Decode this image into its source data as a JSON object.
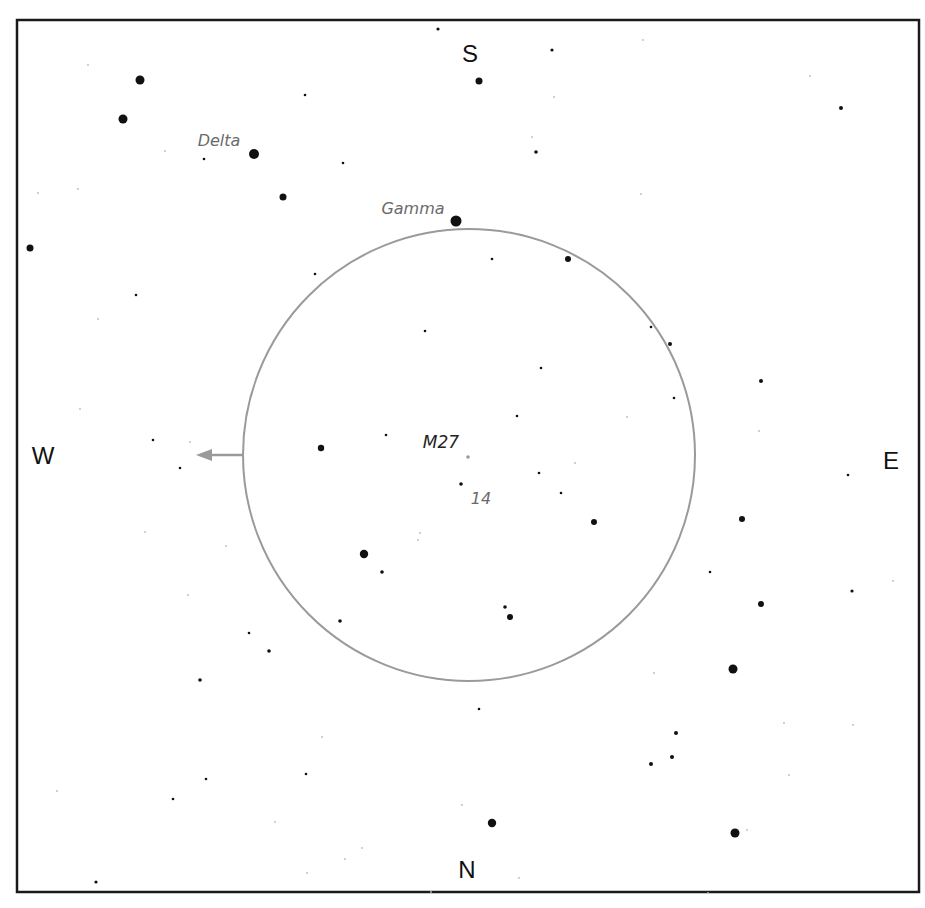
{
  "header": {
    "cropped_title_fragment": ""
  },
  "frame": {
    "x": 17,
    "y": 20,
    "width": 902,
    "height": 872,
    "stroke": "#1a1a1a",
    "stroke_width": 2.5
  },
  "field_of_view": {
    "cx": 469,
    "cy": 455,
    "r": 226,
    "stroke": "#9a9a9a",
    "stroke_width": 2
  },
  "motion_arrow": {
    "x1": 244,
    "y1": 455,
    "x2": 196,
    "y2": 455,
    "color": "#9a9a9a",
    "direction": "west"
  },
  "compass": {
    "north": {
      "label": "N",
      "x": 467,
      "y": 878
    },
    "south": {
      "label": "S",
      "x": 470,
      "y": 62
    },
    "east": {
      "label": "E",
      "x": 891,
      "y": 469
    },
    "west": {
      "label": "W",
      "x": 43,
      "y": 464
    }
  },
  "labels": {
    "delta": {
      "text": "Delta",
      "x": 219,
      "y": 146,
      "color": "#6a6a6a"
    },
    "gamma": {
      "text": "Gamma",
      "x": 413,
      "y": 214,
      "color": "#6a6a6a"
    },
    "m27": {
      "text": "M27",
      "x": 441,
      "y": 448,
      "color": "#222222"
    },
    "mag14": {
      "text": "14",
      "x": 481,
      "y": 504,
      "color": "#6a6a6a"
    }
  },
  "target": {
    "name": "M27",
    "x": 468,
    "y": 457,
    "r": 1.8,
    "color": "#9a9a9a"
  },
  "stars": [
    {
      "x": 140,
      "y": 80,
      "r": 4.5
    },
    {
      "x": 123,
      "y": 119,
      "r": 4.5
    },
    {
      "x": 254,
      "y": 154,
      "r": 5
    },
    {
      "x": 283,
      "y": 197,
      "r": 3.5
    },
    {
      "x": 456,
      "y": 221,
      "r": 5.5
    },
    {
      "x": 30,
      "y": 248,
      "r": 3.5
    },
    {
      "x": 479,
      "y": 81,
      "r": 3.5
    },
    {
      "x": 438,
      "y": 29,
      "r": 1.6
    },
    {
      "x": 552,
      "y": 50,
      "r": 1.6
    },
    {
      "x": 305,
      "y": 95,
      "r": 1.3
    },
    {
      "x": 536,
      "y": 152,
      "r": 1.8
    },
    {
      "x": 204,
      "y": 159,
      "r": 1.3
    },
    {
      "x": 343,
      "y": 163,
      "r": 1.3
    },
    {
      "x": 841,
      "y": 108,
      "r": 2
    },
    {
      "x": 568,
      "y": 259,
      "r": 3
    },
    {
      "x": 492,
      "y": 259,
      "r": 1.3
    },
    {
      "x": 315,
      "y": 274,
      "r": 1.3
    },
    {
      "x": 136,
      "y": 295,
      "r": 1.3
    },
    {
      "x": 425,
      "y": 331,
      "r": 1.3
    },
    {
      "x": 651,
      "y": 327,
      "r": 1.3
    },
    {
      "x": 670,
      "y": 344,
      "r": 2
    },
    {
      "x": 541,
      "y": 368,
      "r": 1.3
    },
    {
      "x": 761,
      "y": 381,
      "r": 2
    },
    {
      "x": 674,
      "y": 398,
      "r": 1.3
    },
    {
      "x": 517,
      "y": 416,
      "r": 1.3
    },
    {
      "x": 386,
      "y": 435,
      "r": 1.3
    },
    {
      "x": 153,
      "y": 440,
      "r": 1.3
    },
    {
      "x": 321,
      "y": 448,
      "r": 3.2
    },
    {
      "x": 180,
      "y": 468,
      "r": 1.3
    },
    {
      "x": 539,
      "y": 473,
      "r": 1.3
    },
    {
      "x": 461,
      "y": 484,
      "r": 1.8
    },
    {
      "x": 561,
      "y": 493,
      "r": 1.3
    },
    {
      "x": 848,
      "y": 475,
      "r": 1.3
    },
    {
      "x": 594,
      "y": 522,
      "r": 3
    },
    {
      "x": 742,
      "y": 519,
      "r": 3
    },
    {
      "x": 364,
      "y": 554,
      "r": 4.2
    },
    {
      "x": 382,
      "y": 572,
      "r": 1.8
    },
    {
      "x": 710,
      "y": 572,
      "r": 1.3
    },
    {
      "x": 852,
      "y": 591,
      "r": 1.6
    },
    {
      "x": 761,
      "y": 604,
      "r": 3
    },
    {
      "x": 505,
      "y": 607,
      "r": 1.8
    },
    {
      "x": 510,
      "y": 617,
      "r": 3
    },
    {
      "x": 340,
      "y": 621,
      "r": 1.8
    },
    {
      "x": 249,
      "y": 633,
      "r": 1.3
    },
    {
      "x": 269,
      "y": 651,
      "r": 1.8
    },
    {
      "x": 733,
      "y": 669,
      "r": 4.5
    },
    {
      "x": 200,
      "y": 680,
      "r": 1.8
    },
    {
      "x": 479,
      "y": 709,
      "r": 1.3
    },
    {
      "x": 676,
      "y": 733,
      "r": 2
    },
    {
      "x": 672,
      "y": 757,
      "r": 2
    },
    {
      "x": 651,
      "y": 764,
      "r": 2
    },
    {
      "x": 306,
      "y": 774,
      "r": 1.3
    },
    {
      "x": 206,
      "y": 779,
      "r": 1.3
    },
    {
      "x": 173,
      "y": 799,
      "r": 1.3
    },
    {
      "x": 492,
      "y": 823,
      "r": 4.2
    },
    {
      "x": 735,
      "y": 833,
      "r": 4.5
    },
    {
      "x": 96,
      "y": 882,
      "r": 1.6
    }
  ],
  "faint_stars": [
    {
      "x": 88,
      "y": 65
    },
    {
      "x": 165,
      "y": 151
    },
    {
      "x": 38,
      "y": 193
    },
    {
      "x": 78,
      "y": 189
    },
    {
      "x": 643,
      "y": 40
    },
    {
      "x": 810,
      "y": 76
    },
    {
      "x": 641,
      "y": 194
    },
    {
      "x": 532,
      "y": 137
    },
    {
      "x": 554,
      "y": 97
    },
    {
      "x": 98,
      "y": 319
    },
    {
      "x": 80,
      "y": 409
    },
    {
      "x": 190,
      "y": 442
    },
    {
      "x": 145,
      "y": 532
    },
    {
      "x": 226,
      "y": 546
    },
    {
      "x": 188,
      "y": 595
    },
    {
      "x": 627,
      "y": 417
    },
    {
      "x": 575,
      "y": 463
    },
    {
      "x": 759,
      "y": 431
    },
    {
      "x": 420,
      "y": 533
    },
    {
      "x": 418,
      "y": 540
    },
    {
      "x": 654,
      "y": 673
    },
    {
      "x": 784,
      "y": 723
    },
    {
      "x": 789,
      "y": 775
    },
    {
      "x": 893,
      "y": 581
    },
    {
      "x": 57,
      "y": 791
    },
    {
      "x": 275,
      "y": 822
    },
    {
      "x": 322,
      "y": 737
    },
    {
      "x": 462,
      "y": 805
    },
    {
      "x": 362,
      "y": 848
    },
    {
      "x": 345,
      "y": 859
    },
    {
      "x": 307,
      "y": 873
    },
    {
      "x": 519,
      "y": 878
    },
    {
      "x": 747,
      "y": 830
    },
    {
      "x": 853,
      "y": 725
    },
    {
      "x": 708,
      "y": 893
    },
    {
      "x": 431,
      "y": 892
    }
  ],
  "colors": {
    "star": "#111111",
    "faint_star": "#bbbbbb",
    "compass_text": "#111111",
    "background": "#ffffff"
  }
}
